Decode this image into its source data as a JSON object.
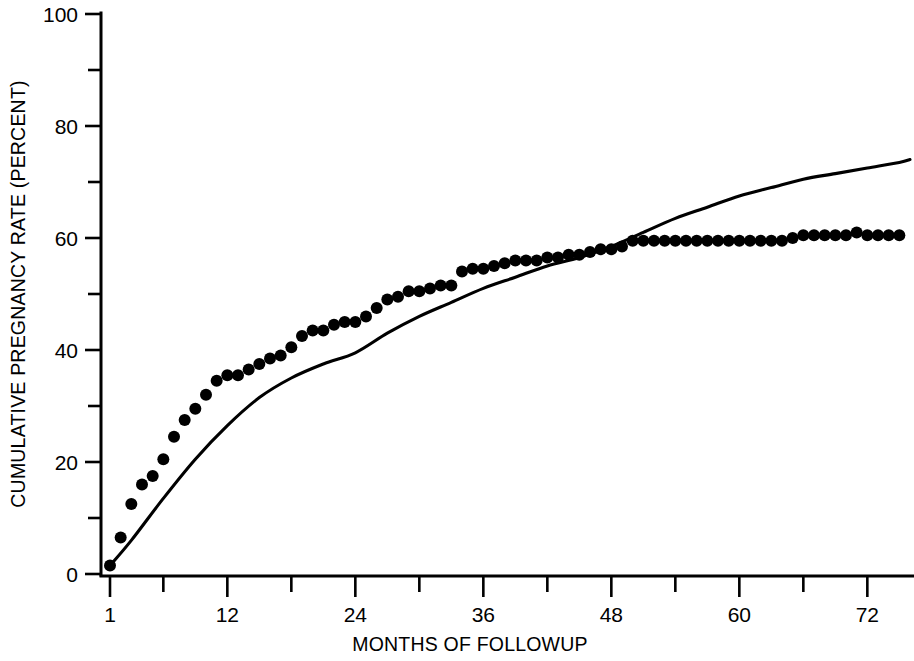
{
  "chart_data": {
    "type": "scatter",
    "title": "",
    "xlabel": "MONTHS OF FOLLOWUP",
    "ylabel": "CUMULATIVE PREGNANCY RATE (PERCENT)",
    "xlim": [
      1,
      76
    ],
    "ylim": [
      0,
      100
    ],
    "grid": false,
    "legend": "none",
    "x_ticks_major": [
      1,
      12,
      24,
      36,
      48,
      60,
      72
    ],
    "x_tick_labels": [
      "1",
      "12",
      "24",
      "36",
      "48",
      "60",
      "72"
    ],
    "x_ticks_minor": [
      6,
      18,
      30,
      42,
      54,
      66
    ],
    "y_ticks_major": [
      0,
      20,
      40,
      60,
      80,
      100
    ],
    "y_tick_labels": [
      "0",
      "20",
      "40",
      "60",
      "80",
      "100"
    ],
    "y_ticks_minor": [
      10,
      30,
      50,
      70,
      90
    ],
    "series": [
      {
        "name": "observed-cumulative-pregnancy-rate",
        "type": "scatter",
        "marker": "filled-circle",
        "color": "#000000",
        "x": [
          1,
          2,
          3,
          4,
          5,
          6,
          7,
          8,
          9,
          10,
          11,
          12,
          13,
          14,
          15,
          16,
          17,
          18,
          19,
          20,
          21,
          22,
          23,
          24,
          25,
          26,
          27,
          28,
          29,
          30,
          31,
          32,
          33,
          34,
          35,
          36,
          37,
          38,
          39,
          40,
          41,
          42,
          43,
          44,
          45,
          46,
          47,
          48,
          49,
          50,
          51,
          52,
          53,
          54,
          55,
          56,
          57,
          58,
          59,
          60,
          61,
          62,
          63,
          64,
          65,
          66,
          67,
          68,
          69,
          70,
          71,
          72,
          73,
          74,
          75
        ],
        "y": [
          1.5,
          6.5,
          12.5,
          16.0,
          17.5,
          20.5,
          24.5,
          27.5,
          29.5,
          32.0,
          34.5,
          35.5,
          35.5,
          36.5,
          37.5,
          38.5,
          39.0,
          40.5,
          42.5,
          43.5,
          43.5,
          44.5,
          45.0,
          45.0,
          46.0,
          47.5,
          49.0,
          49.5,
          50.5,
          50.5,
          51.0,
          51.5,
          51.5,
          54.0,
          54.5,
          54.5,
          55.0,
          55.5,
          56.0,
          56.0,
          56.0,
          56.5,
          56.5,
          57.0,
          57.0,
          57.5,
          58.0,
          58.0,
          58.5,
          59.5,
          59.5,
          59.5,
          59.5,
          59.5,
          59.5,
          59.5,
          59.5,
          59.5,
          59.5,
          59.5,
          59.5,
          59.5,
          59.5,
          59.5,
          60.0,
          60.5,
          60.5,
          60.5,
          60.5,
          60.5,
          61.0,
          60.5,
          60.5,
          60.5,
          60.5
        ]
      },
      {
        "name": "fitted-model-curve",
        "type": "line",
        "color": "#000000",
        "x": [
          1,
          3,
          6,
          9,
          12,
          15,
          18,
          21,
          24,
          27,
          30,
          33,
          36,
          39,
          42,
          45,
          48,
          51,
          54,
          57,
          60,
          63,
          66,
          69,
          72,
          75,
          76
        ],
        "y": [
          1.5,
          6.0,
          13.5,
          20.5,
          26.5,
          31.5,
          35.0,
          37.5,
          39.5,
          43.0,
          46.0,
          48.5,
          51.0,
          53.0,
          55.0,
          56.5,
          58.5,
          61.0,
          63.5,
          65.5,
          67.5,
          69.0,
          70.5,
          71.5,
          72.5,
          73.5,
          74.0
        ]
      }
    ]
  },
  "axis": {
    "y_title": "CUMULATIVE PREGNANCY RATE (PERCENT)",
    "x_title": "MONTHS OF FOLLOWUP"
  }
}
